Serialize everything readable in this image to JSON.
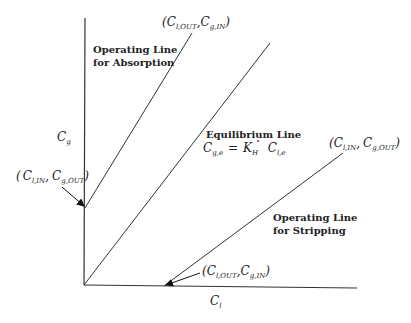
{
  "diagram": {
    "axes": {
      "y_label": "C",
      "y_label_sub": "g",
      "x_label": "C",
      "x_label_sub": "l"
    },
    "lines": {
      "absorption": {
        "label_line1": "Operating Line",
        "label_line2": "for Absorption",
        "top_point": {
          "open": "(",
          "c1": "C",
          "s1": "l,OUT",
          "comma": ",",
          "c2": "C",
          "s2": "g,IN",
          "close": ")"
        },
        "bottom_point": {
          "open": "(",
          "c1": "C",
          "s1": "l,IN",
          "comma": ",",
          "c2": "C",
          "s2": "g,OUT",
          "close": ")"
        }
      },
      "equilibrium": {
        "label": "Equilibrium Line",
        "eq_lhs": "C",
        "eq_lhs_sub": "g,e",
        "eq_equals": "=",
        "eq_k": "K",
        "eq_k_sub": "H",
        "eq_k_sup": "°",
        "eq_rhs": "C",
        "eq_rhs_sub": "l,e"
      },
      "stripping": {
        "label_line1": "Operating Line",
        "label_line2": "for Stripping",
        "top_point": {
          "open": "(",
          "c1": "C",
          "s1": "l,IN",
          "comma": ",",
          "c2": "C",
          "s2": "g,OUT",
          "close": ")"
        },
        "bottom_point": {
          "open": "(",
          "c1": "C",
          "s1": "l,OUT",
          "comma": ",",
          "c2": "C",
          "s2": "g,IN",
          "close": ")"
        }
      }
    }
  }
}
